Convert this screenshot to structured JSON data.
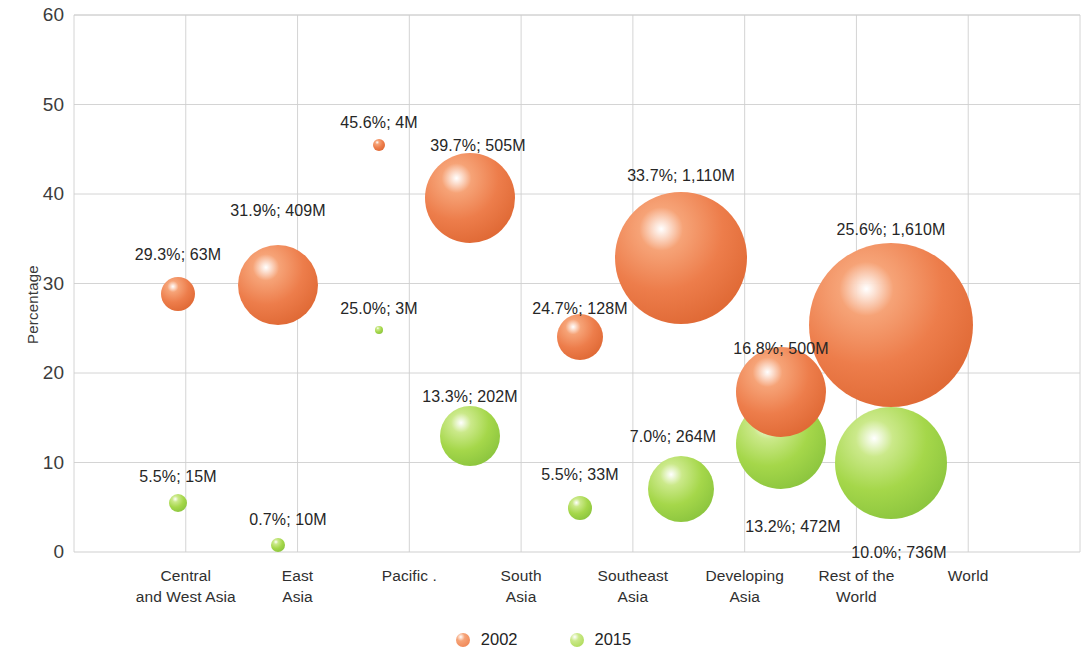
{
  "chart_data": {
    "type": "scatter",
    "chart_subtype": "bubble",
    "title": "",
    "xlabel": "",
    "ylabel": "Percentage",
    "ylim": [
      0,
      60
    ],
    "ytick_step": 10,
    "yticks": [
      "60",
      "50",
      "40",
      "30",
      "20",
      "10",
      "0"
    ],
    "grid": true,
    "legend_position": "bottom",
    "categories": [
      "Central\nand West Asia",
      "East\nAsia",
      "Pacific .",
      "South\nAsia",
      "Southeast\nAsia",
      "Developing\nAsia",
      "Rest of the\nWorld",
      "World"
    ],
    "series": [
      {
        "name": "2002",
        "color": "#ED7D4B",
        "points": [
          {
            "category": "Central and West Asia",
            "percentage": 29.3,
            "size_millions": 63,
            "size_text": "63M",
            "label": "29.3%; 63M"
          },
          {
            "category": "East Asia",
            "percentage": 31.9,
            "size_millions": 409,
            "size_text": "409M",
            "label": "31.9%; 409M"
          },
          {
            "category": "Pacific",
            "percentage": 45.6,
            "size_millions": 4,
            "size_text": "4M",
            "label": "45.6%; 4M"
          },
          {
            "category": "South Asia",
            "percentage": 39.7,
            "size_millions": 505,
            "size_text": "505M",
            "label": "39.7%; 505M"
          },
          {
            "category": "Southeast Asia",
            "percentage": 24.7,
            "size_millions": 128,
            "size_text": "128M",
            "label": "24.7%; 128M"
          },
          {
            "category": "Developing Asia",
            "percentage": 33.7,
            "size_millions": 1110,
            "size_text": "1,110M",
            "label": "33.7%; 1,110M"
          },
          {
            "category": "Rest of the World",
            "percentage": 16.8,
            "size_millions": 500,
            "size_text": "500M",
            "label": "16.8%; 500M"
          },
          {
            "category": "World",
            "percentage": 25.6,
            "size_millions": 1610,
            "size_text": "1,610M",
            "label": "25.6%; 1,610M"
          }
        ]
      },
      {
        "name": "2015",
        "color": "#A5D74A",
        "points": [
          {
            "category": "Central and West Asia",
            "percentage": 5.5,
            "size_millions": 15,
            "size_text": "15M",
            "label": "5.5%; 15M"
          },
          {
            "category": "East Asia",
            "percentage": 0.7,
            "size_millions": 10,
            "size_text": "10M",
            "label": "0.7%; 10M"
          },
          {
            "category": "Pacific",
            "percentage": 25.0,
            "size_millions": 3,
            "size_text": "3M",
            "label": "25.0%; 3M"
          },
          {
            "category": "South Asia",
            "percentage": 13.3,
            "size_millions": 202,
            "size_text": "202M",
            "label": "13.3%; 202M"
          },
          {
            "category": "Southeast Asia",
            "percentage": 5.5,
            "size_millions": 33,
            "size_text": "33M",
            "label": "5.5%; 33M"
          },
          {
            "category": "Developing Asia",
            "percentage": 7.0,
            "size_millions": 264,
            "size_text": "264M",
            "label": "7.0%; 264M"
          },
          {
            "category": "Rest of the World",
            "percentage": 13.2,
            "size_millions": 472,
            "size_text": "472M",
            "label": "13.2%; 472M"
          },
          {
            "category": "World",
            "percentage": 10.0,
            "size_millions": 736,
            "size_text": "736M",
            "label": "10.0%; 736M"
          }
        ]
      }
    ]
  },
  "legend": {
    "entries": [
      {
        "label": "2002",
        "color": "#ED7D4B"
      },
      {
        "label": "2015",
        "color": "#A5D74A"
      }
    ]
  },
  "colors": {
    "series_2002": "#ED7D4B",
    "series_2015": "#A5D74A",
    "grid": "#cfcfcf",
    "text": "#262626",
    "background": "#ffffff"
  },
  "bubble_geometry": {
    "note": "pixel placement of each rendered bubble, matching the source raster",
    "items": [
      {
        "series": "2002",
        "category": "Central and West Asia",
        "cx": 178,
        "cy": 294,
        "r": 17,
        "label_x": 178,
        "label_y": 246
      },
      {
        "series": "2002",
        "category": "East Asia",
        "cx": 278,
        "cy": 285,
        "r": 40,
        "label_x": 278,
        "label_y": 202
      },
      {
        "series": "2002",
        "category": "Pacific",
        "cx": 379,
        "cy": 145,
        "r": 6,
        "label_x": 379,
        "label_y": 114
      },
      {
        "series": "2002",
        "category": "South Asia",
        "cx": 470,
        "cy": 198,
        "r": 45,
        "label_x": 478,
        "label_y": 137
      },
      {
        "series": "2002",
        "category": "Southeast Asia",
        "cx": 580,
        "cy": 337,
        "r": 23,
        "label_x": 580,
        "label_y": 300
      },
      {
        "series": "2002",
        "category": "Developing Asia",
        "cx": 681,
        "cy": 258,
        "r": 66,
        "label_x": 681,
        "label_y": 167
      },
      {
        "series": "2002",
        "category": "Rest of the World",
        "cx": 781,
        "cy": 392,
        "r": 45,
        "label_x": 781,
        "label_y": 340
      },
      {
        "series": "2002",
        "category": "World",
        "cx": 891,
        "cy": 325,
        "r": 82,
        "label_x": 891,
        "label_y": 221
      },
      {
        "series": "2015",
        "category": "Central and West Asia",
        "cx": 178,
        "cy": 503,
        "r": 9,
        "label_x": 178,
        "label_y": 468
      },
      {
        "series": "2015",
        "category": "East Asia",
        "cx": 278,
        "cy": 545,
        "r": 7,
        "label_x": 288,
        "label_y": 511
      },
      {
        "series": "2015",
        "category": "Pacific",
        "cx": 379,
        "cy": 330,
        "r": 4,
        "label_x": 379,
        "label_y": 300
      },
      {
        "series": "2015",
        "category": "South Asia",
        "cx": 470,
        "cy": 436,
        "r": 30,
        "label_x": 470,
        "label_y": 388
      },
      {
        "series": "2015",
        "category": "Southeast Asia",
        "cx": 580,
        "cy": 508,
        "r": 12,
        "label_x": 580,
        "label_y": 466
      },
      {
        "series": "2015",
        "category": "Developing Asia",
        "cx": 681,
        "cy": 489,
        "r": 33,
        "label_x": 673,
        "label_y": 428
      },
      {
        "series": "2015",
        "category": "Rest of the World",
        "cx": 781,
        "cy": 444,
        "r": 45,
        "label_x": 793,
        "label_y": 518
      },
      {
        "series": "2015",
        "category": "World",
        "cx": 891,
        "cy": 463,
        "r": 56,
        "label_x": 899,
        "label_y": 544
      }
    ]
  }
}
